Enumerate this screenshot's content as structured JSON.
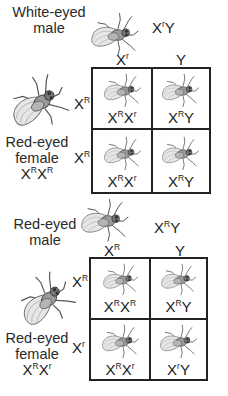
{
  "crosses": [
    {
      "id": "cross-1",
      "male": {
        "label_line1": "White-eyed",
        "label_line2": "male",
        "genotype": {
          "base1": "X",
          "sup1": "r",
          "base2": "Y",
          "sup2": ""
        }
      },
      "female": {
        "label_line1": "Red-eyed",
        "label_line2": "female",
        "genotype": {
          "base1": "X",
          "sup1": "R",
          "base2": "X",
          "sup2": "R"
        }
      },
      "column_headers": [
        {
          "base": "X",
          "sup": "r"
        },
        {
          "base": "Y",
          "sup": ""
        }
      ],
      "row_headers": [
        {
          "base": "X",
          "sup": "R"
        },
        {
          "base": "X",
          "sup": "R"
        }
      ],
      "cells": [
        [
          {
            "base1": "X",
            "sup1": "R",
            "base2": "X",
            "sup2": "r"
          },
          {
            "base1": "X",
            "sup1": "R",
            "base2": "Y",
            "sup2": ""
          }
        ],
        [
          {
            "base1": "X",
            "sup1": "R",
            "base2": "X",
            "sup2": "r"
          },
          {
            "base1": "X",
            "sup1": "R",
            "base2": "Y",
            "sup2": ""
          }
        ]
      ]
    },
    {
      "id": "cross-2",
      "male": {
        "label_line1": "Red-eyed",
        "label_line2": "male",
        "genotype": {
          "base1": "X",
          "sup1": "R",
          "base2": "Y",
          "sup2": ""
        }
      },
      "female": {
        "label_line1": "Red-eyed",
        "label_line2": "female",
        "genotype": {
          "base1": "X",
          "sup1": "R",
          "base2": "X",
          "sup2": "r"
        }
      },
      "column_headers": [
        {
          "base": "X",
          "sup": "R"
        },
        {
          "base": "Y",
          "sup": ""
        }
      ],
      "row_headers": [
        {
          "base": "X",
          "sup": "R"
        },
        {
          "base": "X",
          "sup": "r"
        }
      ],
      "cells": [
        [
          {
            "base1": "X",
            "sup1": "R",
            "base2": "X",
            "sup2": "R"
          },
          {
            "base1": "X",
            "sup1": "R",
            "base2": "Y",
            "sup2": ""
          }
        ],
        [
          {
            "base1": "X",
            "sup1": "R",
            "base2": "X",
            "sup2": "r"
          },
          {
            "base1": "X",
            "sup1": "r",
            "base2": "Y",
            "sup2": ""
          }
        ]
      ]
    }
  ],
  "icons": {
    "fly": "fruit-fly-drawing"
  }
}
